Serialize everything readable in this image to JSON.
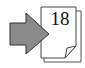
{
  "icon": {
    "name": "go-to-page",
    "page_number": "18",
    "colors": {
      "arrow_fill": "#8a8a8a",
      "arrow_stroke": "#333333",
      "page_fill": "#ffffff",
      "page_stroke": "#444444"
    }
  }
}
